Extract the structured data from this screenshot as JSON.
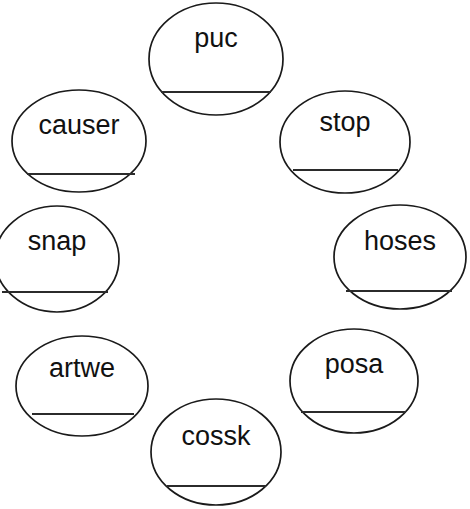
{
  "page": {
    "background_color": "#ffffff",
    "width": 470,
    "height": 509
  },
  "style": {
    "ellipse_stroke_color": "#1a1a1a",
    "ellipse_fill_color": "#ffffff",
    "ellipse_stroke_width": 1.7,
    "blank_line_color": "#2b2b2b",
    "blank_line_width": 1.8,
    "word_text_color": "#111111",
    "word_font_size": 27
  },
  "layout": {
    "arrangement": "ring",
    "bubble_count": 8
  },
  "bubbles": [
    {
      "id": "bubble-puc",
      "word": "puc",
      "position": "top",
      "cx": 216,
      "cy": 59,
      "rx": 67,
      "ry": 56,
      "word_y": 47,
      "line_y": 92,
      "line_x1": 161,
      "line_x2": 271,
      "clipped": false
    },
    {
      "id": "bubble-stop",
      "word": "stop",
      "position": "upper-right",
      "cx": 345,
      "cy": 142,
      "rx": 65,
      "ry": 51,
      "word_y": 131,
      "line_y": 170,
      "line_x1": 293,
      "line_x2": 398,
      "clipped": false
    },
    {
      "id": "bubble-hoses",
      "word": "hoses",
      "position": "right",
      "cx": 400,
      "cy": 257,
      "rx": 66,
      "ry": 52,
      "word_y": 250,
      "line_y": 291,
      "line_x1": 346,
      "line_x2": 452,
      "clipped": true
    },
    {
      "id": "bubble-posa",
      "word": "posa",
      "position": "lower-right",
      "cx": 354,
      "cy": 381,
      "rx": 64,
      "ry": 52,
      "word_y": 373,
      "line_y": 412,
      "line_x1": 301,
      "line_x2": 406,
      "clipped": false
    },
    {
      "id": "bubble-cossk",
      "word": "cossk",
      "position": "bottom",
      "cx": 216,
      "cy": 452,
      "rx": 65,
      "ry": 53,
      "word_y": 445,
      "line_y": 486,
      "line_x1": 167,
      "line_x2": 266,
      "clipped": true
    },
    {
      "id": "bubble-artwe",
      "word": "artwe",
      "position": "lower-left",
      "cx": 82,
      "cy": 386,
      "rx": 66,
      "ry": 50,
      "word_y": 377,
      "line_y": 414,
      "line_x1": 32,
      "line_x2": 134,
      "clipped": false
    },
    {
      "id": "bubble-snap",
      "word": "snap",
      "position": "left",
      "cx": 57,
      "cy": 259,
      "rx": 62,
      "ry": 53,
      "word_y": 250,
      "line_y": 292,
      "line_x1": 2,
      "line_x2": 108,
      "clipped": true
    },
    {
      "id": "bubble-causer",
      "word": "causer",
      "position": "upper-left",
      "cx": 79,
      "cy": 141,
      "rx": 67,
      "ry": 51,
      "word_y": 134,
      "line_y": 174,
      "line_x1": 27,
      "line_x2": 135,
      "clipped": false
    }
  ]
}
